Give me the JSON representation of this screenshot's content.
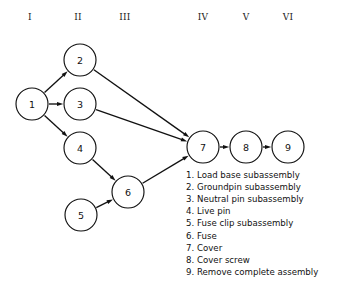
{
  "diagram": {
    "type": "precedence-network",
    "column_headers": [
      {
        "label": "I",
        "x": 30
      },
      {
        "label": "II",
        "x": 78
      },
      {
        "label": "III",
        "x": 125
      },
      {
        "label": "IV",
        "x": 203
      },
      {
        "label": "V",
        "x": 246
      },
      {
        "label": "VI",
        "x": 288
      }
    ],
    "header_y": 20,
    "node_radius": 16,
    "nodes": [
      {
        "id": "1",
        "label": "1",
        "cx": 32,
        "cy": 104
      },
      {
        "id": "2",
        "label": "2",
        "cx": 80,
        "cy": 60
      },
      {
        "id": "3",
        "label": "3",
        "cx": 80,
        "cy": 104
      },
      {
        "id": "4",
        "label": "4",
        "cx": 80,
        "cy": 148
      },
      {
        "id": "5",
        "label": "5",
        "cx": 81,
        "cy": 215
      },
      {
        "id": "6",
        "label": "6",
        "cx": 128,
        "cy": 192
      },
      {
        "id": "7",
        "label": "7",
        "cx": 203,
        "cy": 147
      },
      {
        "id": "8",
        "label": "8",
        "cx": 246,
        "cy": 147
      },
      {
        "id": "9",
        "label": "9",
        "cx": 288,
        "cy": 147
      }
    ],
    "edges": [
      {
        "from": "1",
        "to": "2"
      },
      {
        "from": "1",
        "to": "3"
      },
      {
        "from": "1",
        "to": "4"
      },
      {
        "from": "2",
        "to": "7"
      },
      {
        "from": "3",
        "to": "7"
      },
      {
        "from": "4",
        "to": "6"
      },
      {
        "from": "5",
        "to": "6"
      },
      {
        "from": "6",
        "to": "7"
      },
      {
        "from": "7",
        "to": "8"
      },
      {
        "from": "8",
        "to": "9"
      }
    ],
    "line_color": "#111111",
    "node_fill": "#ffffff",
    "background": "#ffffff"
  },
  "legend": {
    "x": 186,
    "y_start": 178,
    "line_height": 12.1,
    "items": [
      {
        "num": "1.",
        "text": "Load base subassembly"
      },
      {
        "num": "2.",
        "text": "Groundpin subassembly"
      },
      {
        "num": "3.",
        "text": "Neutral pin subassembly"
      },
      {
        "num": "4.",
        "text": "Live pin"
      },
      {
        "num": "5.",
        "text": "Fuse clip subassembly"
      },
      {
        "num": "6.",
        "text": "Fuse"
      },
      {
        "num": "7.",
        "text": "Cover"
      },
      {
        "num": "8.",
        "text": "Cover screw"
      },
      {
        "num": "9.",
        "text": "Remove complete assembly"
      }
    ]
  }
}
